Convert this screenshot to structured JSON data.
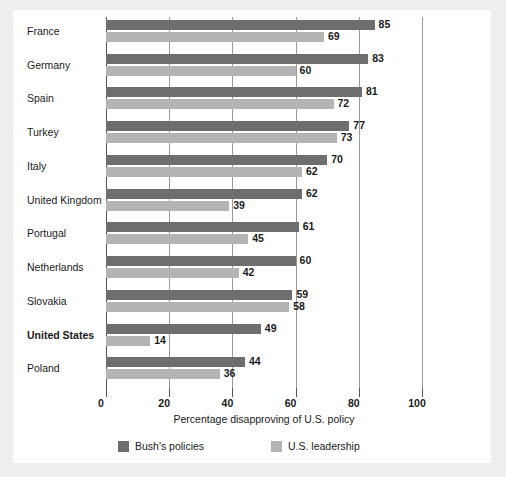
{
  "chart_data": {
    "type": "bar",
    "orientation": "horizontal",
    "title": "",
    "xlabel": "Percentage disapproving of U.S. policy",
    "ylabel": "",
    "xlim": [
      0,
      100
    ],
    "xticks": [
      0,
      20,
      40,
      60,
      80,
      100
    ],
    "xtick_labels": [
      "0",
      "20",
      "40",
      "60",
      "80",
      "100"
    ],
    "grid": true,
    "grid_axis": "x",
    "legend_position": "bottom",
    "categories": [
      "France",
      "Germany",
      "Spain",
      "Turkey",
      "Italy",
      "United Kingdom",
      "Portugal",
      "Netherlands",
      "Slovakia",
      "United States",
      "Poland"
    ],
    "emphasized_categories": [
      "United States"
    ],
    "series": [
      {
        "name": "Bush's policies",
        "color": "#6e6e6e",
        "values": [
          85,
          83,
          81,
          77,
          70,
          62,
          61,
          60,
          59,
          49,
          44
        ]
      },
      {
        "name": "U.S. leadership",
        "color": "#b4b4b4",
        "values": [
          69,
          60,
          72,
          73,
          62,
          39,
          45,
          42,
          58,
          14,
          36
        ]
      }
    ]
  },
  "legend": {
    "items": [
      {
        "label": "Bush's policies",
        "color": "#6e6e6e"
      },
      {
        "label": "U.S. leadership",
        "color": "#b4b4b4"
      }
    ]
  }
}
